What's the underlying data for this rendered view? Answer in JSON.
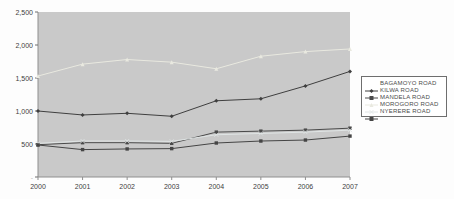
{
  "chart_data": {
    "type": "line",
    "title": "",
    "xlabel": "",
    "ylabel": "",
    "x": [
      "2000",
      "2001",
      "2002",
      "2003",
      "2004",
      "2005",
      "2006",
      "2007"
    ],
    "y_ticks": [
      "2,500",
      "2,000",
      "1,500",
      "1,000",
      "500",
      "-"
    ],
    "ylim": [
      0,
      2500
    ],
    "grid": false,
    "legend_position": "right",
    "plot_bg": "#c9c9c9",
    "axis_color": "#8f8f8f",
    "series": [
      {
        "name": "BAGAMOYO ROAD",
        "marker": "diamond",
        "color": "#3f3f3f",
        "values": [
          1000,
          940,
          965,
          920,
          1155,
          1185,
          1380,
          1600
        ]
      },
      {
        "name": "KILWA ROAD",
        "marker": "square",
        "color": "#4a4a4a",
        "values": [
          490,
          520,
          520,
          510,
          680,
          695,
          710,
          740
        ]
      },
      {
        "name": "MANDELA ROAD",
        "marker": "triangle",
        "color": "#e9e9e0",
        "values": [
          1530,
          1710,
          1780,
          1740,
          1640,
          1830,
          1900,
          1940
        ]
      },
      {
        "name": "MOROGORO ROAD",
        "marker": "x",
        "color": "#e0e5e5",
        "values": [
          510,
          545,
          545,
          540,
          640,
          660,
          680,
          710
        ]
      },
      {
        "name": "NYERERE ROAD",
        "marker": "star",
        "color": "#454545",
        "values": [
          485,
          415,
          425,
          430,
          515,
          545,
          560,
          620
        ]
      }
    ]
  }
}
